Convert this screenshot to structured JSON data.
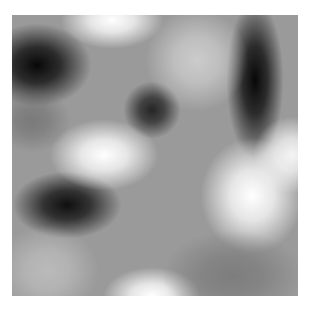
{
  "image": {
    "description": "Blurred grayscale noise field",
    "base_color": "#9a9a9a",
    "frame": {
      "x": 12,
      "y": 15,
      "w": 286,
      "h": 281
    },
    "blobs": [
      {
        "name": "dark-blob-top-left",
        "cx": 25,
        "cy": 50,
        "rx": 42,
        "ry": 32,
        "color": "#000000",
        "alpha": 0.95
      },
      {
        "name": "dark-bar-top-right",
        "cx": 243,
        "cy": 65,
        "rx": 22,
        "ry": 62,
        "color": "#000000",
        "alpha": 0.95
      },
      {
        "name": "dark-spot-center",
        "cx": 140,
        "cy": 95,
        "rx": 22,
        "ry": 22,
        "color": "#111111",
        "alpha": 0.85
      },
      {
        "name": "dark-blob-left-mid",
        "cx": 55,
        "cy": 190,
        "rx": 42,
        "ry": 26,
        "color": "#000000",
        "alpha": 0.9
      },
      {
        "name": "light-blob-center-left",
        "cx": 92,
        "cy": 140,
        "rx": 42,
        "ry": 28,
        "color": "#ffffff",
        "alpha": 1.0
      },
      {
        "name": "light-blob-right",
        "cx": 240,
        "cy": 180,
        "rx": 40,
        "ry": 45,
        "color": "#ffffff",
        "alpha": 1.0
      },
      {
        "name": "light-streak-right-edge",
        "cx": 280,
        "cy": 140,
        "rx": 30,
        "ry": 30,
        "color": "#ffffff",
        "alpha": 0.9
      },
      {
        "name": "light-blob-top",
        "cx": 100,
        "cy": 5,
        "rx": 40,
        "ry": 22,
        "color": "#ffffff",
        "alpha": 1.0
      },
      {
        "name": "light-blob-bottom",
        "cx": 140,
        "cy": 281,
        "rx": 38,
        "ry": 22,
        "color": "#ffffff",
        "alpha": 1.0
      },
      {
        "name": "light-patch-top-mid",
        "cx": 185,
        "cy": 45,
        "rx": 40,
        "ry": 40,
        "color": "#e0e0e0",
        "alpha": 0.7
      },
      {
        "name": "light-patch-bottom-left",
        "cx": 35,
        "cy": 255,
        "rx": 40,
        "ry": 35,
        "color": "#d0d0d0",
        "alpha": 0.6
      },
      {
        "name": "gray-patch-bottom-right",
        "cx": 220,
        "cy": 260,
        "rx": 55,
        "ry": 35,
        "color": "#6a6a6a",
        "alpha": 0.6
      },
      {
        "name": "gray-patch-left-top",
        "cx": 20,
        "cy": 105,
        "rx": 30,
        "ry": 25,
        "color": "#5a5a5a",
        "alpha": 0.5
      }
    ]
  }
}
